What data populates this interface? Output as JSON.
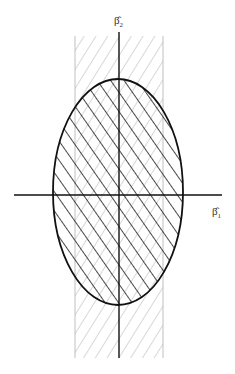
{
  "diagram": {
    "axes": {
      "horizontal_label": "β̂",
      "horizontal_subscript": "1",
      "vertical_label": "β̂",
      "vertical_subscript": "2"
    },
    "regions": [
      {
        "name": "vertical-band",
        "hatch": "light diagonal (/)",
        "color": "#9a9a9a"
      },
      {
        "name": "ellipse",
        "hatch": "bold diagonal (\\)",
        "color": "#1a1a1a"
      }
    ],
    "colors": {
      "axis": "#111111",
      "ellipse_stroke": "#111111",
      "band_hatch": "#9a9a9a",
      "ellipse_hatch": "#1a1a1a",
      "background": "#ffffff"
    }
  }
}
